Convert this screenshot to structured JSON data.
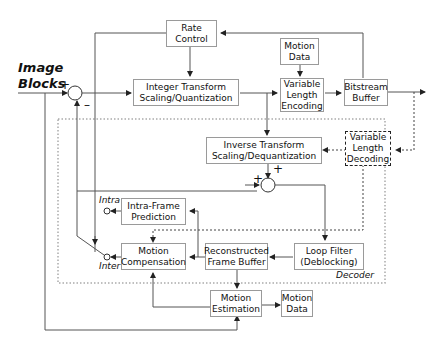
{
  "input_label": "Image\nBlocks",
  "decoder_label": "Decoder",
  "blocks": {
    "rate_control": "Rate\nControl",
    "integer_transform": "Integer Transform\nScaling/Quantization",
    "motion_data_top": "Motion\nData",
    "vlc": "Variable\nLength\nEncoding",
    "bitstream_buffer": "Bitstream\nBuffer",
    "inverse_transform": "Inverse Transform\nScaling/Dequantization",
    "vld": "Variable\nLength\nDecoding",
    "intra_prediction": "Intra-Frame\nPrediction",
    "motion_compensation": "Motion\nCompensation",
    "frame_buffer": "Reconstructed\nFrame Buffer",
    "loop_filter": "Loop Filter\n(Deblocking)",
    "motion_estimation": "Motion\nEstimation",
    "motion_data_bottom": "Motion\nData"
  },
  "signs": {
    "sum1_plus": "+",
    "sum1_minus": "–",
    "sum2_plus_left": "+",
    "sum2_plus_top": "+"
  },
  "switch": {
    "intra": "Intra",
    "inter": "Inter"
  },
  "colors": {
    "line": "#555555",
    "box_border": "#9a9a9a",
    "decoder_border": "#aaaaaa"
  }
}
